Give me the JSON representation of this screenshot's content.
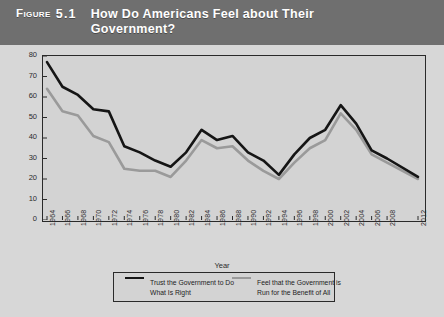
{
  "header": {
    "figure_label": "Figure",
    "figure_number": "5.1",
    "title": "How Do Americans Feel about Their Government?"
  },
  "legend": {
    "series_black_label": "Trust the Government to Do What Is Right",
    "series_gray_label": "Feel that the Government is Run for the Benefit of All"
  },
  "colors": {
    "header_band": "#6f6f6f",
    "plot_background": "#d3d3d3",
    "page_background": "#d7d7d7",
    "series_black": "#151515",
    "series_gray": "#9a9a9a",
    "axis": "#2a2a2a"
  },
  "chart_data": {
    "type": "line",
    "title": "How Do Americans Feel about Their Government?",
    "xlabel": "Year",
    "ylabel": "Percent of Americans",
    "xlim": [
      1964,
      2012
    ],
    "ylim": [
      0,
      80
    ],
    "yticks": [
      0,
      10,
      20,
      30,
      40,
      50,
      60,
      70,
      80
    ],
    "grid": false,
    "legend_position": "bottom",
    "categories": [
      1964,
      1966,
      1968,
      1970,
      1972,
      1974,
      1976,
      1978,
      1980,
      1982,
      1984,
      1986,
      1988,
      1990,
      1992,
      1994,
      1996,
      1998,
      2000,
      2002,
      2004,
      2006,
      2008,
      2012
    ],
    "tick_labels": [
      "1964",
      "1966",
      "1968",
      "1970",
      "1972",
      "1974",
      "1976",
      "1978",
      "1980",
      "1982",
      "1984",
      "1986",
      "1988",
      "1990",
      "1992",
      "1994",
      "1996",
      "1998",
      "2000",
      "2002",
      "2004",
      "2006",
      "2008",
      "2012"
    ],
    "series": [
      {
        "name": "Trust the Government to Do What Is Right",
        "color": "#151515",
        "values": [
          77,
          65,
          61,
          54,
          53,
          36,
          33,
          29,
          26,
          33,
          44,
          39,
          41,
          33,
          29,
          22,
          32,
          40,
          44,
          56,
          47,
          34,
          30,
          21
        ]
      },
      {
        "name": "Feel that the Government is Run for the Benefit of All",
        "color": "#9a9a9a",
        "values": [
          64,
          53,
          51,
          41,
          38,
          25,
          24,
          24,
          21,
          29,
          39,
          35,
          36,
          29,
          24,
          20,
          28,
          35,
          39,
          52,
          44,
          32,
          28,
          20
        ]
      }
    ]
  }
}
